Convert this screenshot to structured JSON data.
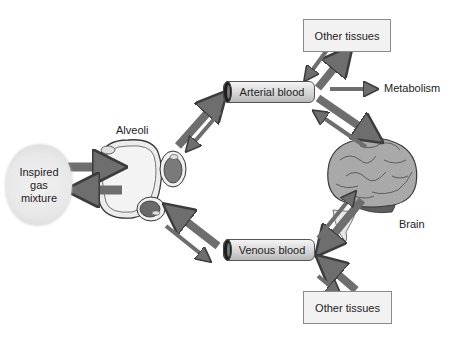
{
  "diagram": {
    "type": "physiology-flow",
    "nodes": {
      "inspired_gas": {
        "lines": [
          "Inspired",
          "gas",
          "mixture"
        ]
      },
      "alveoli": {
        "label": "Alveoli"
      },
      "arterial_blood": {
        "label": "Arterial blood"
      },
      "venous_blood": {
        "label": "Venous blood"
      },
      "other_tissues_top": {
        "label": "Other tissues"
      },
      "other_tissues_bottom": {
        "label": "Other tissues"
      },
      "metabolism": {
        "label": "Metabolism"
      },
      "brain": {
        "label": "Brain"
      }
    },
    "edges": [
      {
        "from": "inspired_gas",
        "to": "alveoli",
        "style": "thick"
      },
      {
        "from": "alveoli",
        "to": "inspired_gas",
        "style": "thick"
      },
      {
        "from": "alveoli",
        "to": "arterial_blood",
        "style": "thick"
      },
      {
        "from": "arterial_blood",
        "to": "alveoli",
        "style": "thin"
      },
      {
        "from": "arterial_blood",
        "to": "other_tissues_top",
        "style": "thick"
      },
      {
        "from": "other_tissues_top",
        "to": "arterial_blood",
        "style": "thin"
      },
      {
        "from": "arterial_blood",
        "to": "metabolism",
        "style": "thin"
      },
      {
        "from": "arterial_blood",
        "to": "brain",
        "style": "thick"
      },
      {
        "from": "brain",
        "to": "arterial_blood",
        "style": "thin"
      },
      {
        "from": "brain",
        "to": "venous_blood",
        "style": "thick"
      },
      {
        "from": "venous_blood",
        "to": "brain",
        "style": "thin"
      },
      {
        "from": "other_tissues_bottom",
        "to": "venous_blood",
        "style": "thick"
      },
      {
        "from": "venous_blood",
        "to": "other_tissues_bottom",
        "style": "thin"
      },
      {
        "from": "venous_blood",
        "to": "alveoli",
        "style": "thick"
      },
      {
        "from": "alveoli",
        "to": "venous_blood",
        "style": "thin"
      }
    ],
    "colors": {
      "arrow_fill": "#6e6e6e",
      "arrow_stroke": "#3c3c3c",
      "box_fill": "#f2f2f2",
      "brain_fill": "#a9a9a9"
    }
  }
}
